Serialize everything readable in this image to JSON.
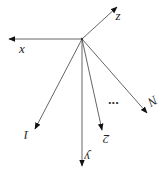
{
  "diagram": {
    "type": "vector-fan",
    "origin": [
      82,
      39
    ],
    "colors": {
      "line": "#555555",
      "text": "#222222",
      "arrow": "#111111"
    },
    "axes": [
      {
        "name": "x",
        "label": "x",
        "tip": [
          9,
          39
        ],
        "label_pos": [
          22,
          50
        ],
        "rotate": 0
      },
      {
        "name": "z",
        "label": "z",
        "tip": [
          117,
          7
        ],
        "label_pos": [
          118,
          17
        ],
        "rotate": 0
      },
      {
        "name": "y",
        "label": "y",
        "tip": [
          82,
          166
        ],
        "label_pos": [
          87,
          156
        ],
        "rotate": 180
      }
    ],
    "vectors": [
      {
        "name": "1",
        "label": "1",
        "tip": [
          35,
          129
        ],
        "label_pos": [
          26,
          134
        ],
        "rotate": 180
      },
      {
        "name": "2",
        "label": "2",
        "tip": [
          102,
          130
        ],
        "label_pos": [
          106,
          138
        ],
        "rotate": 180
      },
      {
        "name": "N",
        "label": "N",
        "tip": [
          147,
          113
        ],
        "label_pos": [
          152,
          100
        ],
        "rotate": 150
      }
    ],
    "ellipsis": {
      "label": "...",
      "pos": [
        108,
        104
      ]
    }
  }
}
